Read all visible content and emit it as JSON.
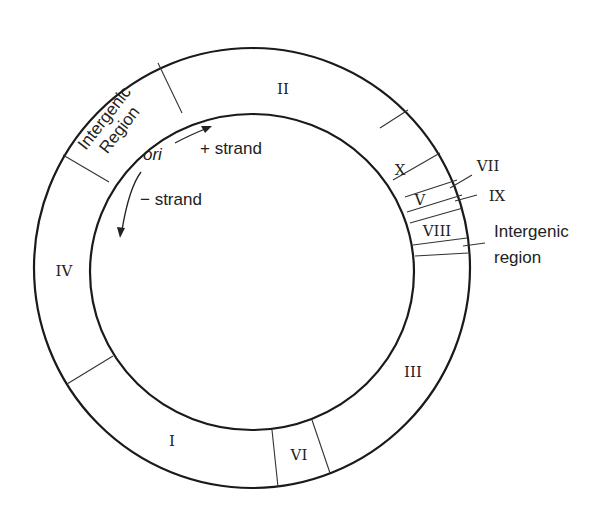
{
  "diagram": {
    "type": "circular genome map",
    "segments": [
      {
        "id": "II",
        "label": "II"
      },
      {
        "id": "X",
        "label": "X"
      },
      {
        "id": "V",
        "label": "V"
      },
      {
        "id": "VII",
        "label": "VII"
      },
      {
        "id": "IX",
        "label": "IX"
      },
      {
        "id": "VIII",
        "label": "VIII"
      },
      {
        "id": "III",
        "label": "III"
      },
      {
        "id": "VI",
        "label": "VI"
      },
      {
        "id": "I",
        "label": "I"
      },
      {
        "id": "IV",
        "label": "IV"
      }
    ],
    "intergenic_top": {
      "line1": "Intergenic",
      "line2": "Region"
    },
    "intergenic_right": {
      "line1": "Intergenic",
      "line2": "region"
    },
    "origin_label": "ori",
    "plus_strand_label": "+ strand",
    "minus_strand_label": "− strand",
    "colors": {
      "stroke": "#1a1a1a",
      "background": "#ffffff"
    }
  }
}
